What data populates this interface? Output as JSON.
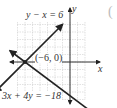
{
  "chart_data": {
    "type": "line",
    "title": "",
    "xlabel": "x",
    "ylabel": "y",
    "grid": true,
    "xlim": [
      -8,
      2
    ],
    "ylim": [
      -5,
      6
    ],
    "series": [
      {
        "name": "y - x = 6",
        "equation": "y - x = 6",
        "x": [
          -10,
          -1
        ],
        "y": [
          -4,
          5
        ],
        "arrows": "both"
      },
      {
        "name": "3x + 4y = -18",
        "equation": "3x + 4y = -18",
        "x": [
          -8,
          4
        ],
        "y": [
          1.5,
          -7.5
        ],
        "arrows": "both"
      }
    ],
    "annotations": [
      {
        "text": "(-6, 0)",
        "x": -6,
        "y": 0,
        "type": "intersection-point"
      }
    ]
  },
  "labels": {
    "line1": "y − x = 6",
    "line2": "3x + 4y = −18",
    "point": "(−6, 0)",
    "x_axis": "x",
    "y_axis": "y",
    "paren": "("
  },
  "colors": {
    "grid": "#cfcfcf",
    "axis": "#333333",
    "line": "#222222"
  }
}
